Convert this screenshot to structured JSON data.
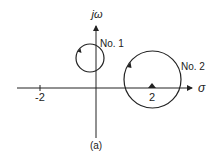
{
  "diagram": {
    "type": "s-plane contour diagram",
    "caption": "(a)",
    "axes": {
      "horizontal_label": "σ",
      "vertical_label": "jω",
      "ticks": [
        {
          "label": "-2",
          "value": -2
        },
        {
          "label": "2",
          "value": 2
        }
      ]
    },
    "contours": [
      {
        "label": "No. 1",
        "center": [
          -0.2,
          0.55
        ],
        "radius": 0.25,
        "direction": "clockwise"
      },
      {
        "label": "No. 2",
        "center": [
          2,
          0.15
        ],
        "radius": 1.0,
        "direction": "clockwise"
      }
    ],
    "markers": [
      {
        "shape": "triangle",
        "position": [
          2,
          0
        ]
      }
    ],
    "colors": {
      "stroke": "#222222",
      "background": "#ffffff"
    }
  }
}
